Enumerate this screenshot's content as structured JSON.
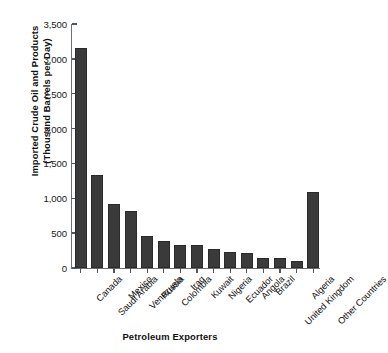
{
  "chart_data": {
    "type": "bar",
    "title": "",
    "xlabel": "Petroleum Exporters",
    "ylabel_line1": "Imported Crude Oil and Products",
    "ylabel_line2": "(Thousand Barrels per Day)",
    "ylabel": "Imported Crude Oil and Products (Thousand Barrels per Day)",
    "categories": [
      "Canada",
      "Saudi Arabia",
      "Mexico",
      "Venezuela",
      "Russia",
      "Colombia",
      "Iraq",
      "Kuwait",
      "Nigeria",
      "Ecuador",
      "Angola",
      "Brazil",
      "United Kingdom",
      "Algeria",
      "Other Countries"
    ],
    "values": [
      3150,
      1330,
      920,
      815,
      460,
      385,
      335,
      325,
      275,
      230,
      210,
      150,
      140,
      105,
      1090
    ],
    "ylim": [
      0,
      3500
    ],
    "ytick_values": [
      0,
      500,
      1000,
      1500,
      2000,
      2500,
      3000,
      3500
    ],
    "ytick_labels": [
      "0",
      "500",
      "1,000",
      "1,500",
      "2,000",
      "2,500",
      "3,000",
      "3,500"
    ],
    "grid": false,
    "legend": null,
    "bar_color": "#3a3a3a",
    "axis_color": "#6e6e6e",
    "text_color": "#111111"
  }
}
